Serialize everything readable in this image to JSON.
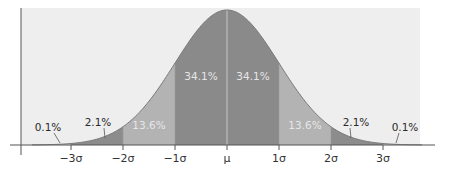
{
  "chart_data": {
    "type": "area",
    "title": "",
    "xlabel": "",
    "ylabel": "",
    "distribution": "normal",
    "mean": 0,
    "sd": 1,
    "xlim": [
      -3.75,
      3.75
    ],
    "grid": false,
    "legend": "none",
    "x_ticks": [
      {
        "value": -3,
        "label": "−3σ"
      },
      {
        "value": -2,
        "label": "−2σ"
      },
      {
        "value": -1,
        "label": "−1σ"
      },
      {
        "value": 0,
        "label": "μ"
      },
      {
        "value": 1,
        "label": "1σ"
      },
      {
        "value": 2,
        "label": "2σ"
      },
      {
        "value": 3,
        "label": "3σ"
      }
    ],
    "regions": [
      {
        "name": "beyond -3sd",
        "from": -3.75,
        "to": -3,
        "percent": 0.1,
        "label": "0.1%",
        "color": "#d4d4d4",
        "label_placement": "outside"
      },
      {
        "name": "-3sd to -2sd",
        "from": -3,
        "to": -2,
        "percent": 2.1,
        "label": "2.1%",
        "color": "#8c8c8c",
        "label_placement": "outside"
      },
      {
        "name": "-2sd to -1sd",
        "from": -2,
        "to": -1,
        "percent": 13.6,
        "label": "13.6%",
        "color": "#b3b3b3",
        "label_placement": "inside"
      },
      {
        "name": "-1sd to mean",
        "from": -1,
        "to": 0,
        "percent": 34.1,
        "label": "34.1%",
        "color": "#8a8a8a",
        "label_placement": "inside"
      },
      {
        "name": "mean to 1sd",
        "from": 0,
        "to": 1,
        "percent": 34.1,
        "label": "34.1%",
        "color": "#8a8a8a",
        "label_placement": "inside"
      },
      {
        "name": "1sd to 2sd",
        "from": 1,
        "to": 2,
        "percent": 13.6,
        "label": "13.6%",
        "color": "#b3b3b3",
        "label_placement": "inside"
      },
      {
        "name": "2sd to 3sd",
        "from": 2,
        "to": 3,
        "percent": 2.1,
        "label": "2.1%",
        "color": "#8c8c8c",
        "label_placement": "outside"
      },
      {
        "name": "beyond 3sd",
        "from": 3,
        "to": 3.75,
        "percent": 0.1,
        "label": "0.1%",
        "color": "#d4d4d4",
        "label_placement": "outside"
      }
    ],
    "colors": {
      "panel_background": "#eeeeee",
      "axis": "#555555",
      "curve_edge": "#7a7a7a",
      "mean_line": "#c8c8c8",
      "leader_line": "#555555"
    }
  }
}
